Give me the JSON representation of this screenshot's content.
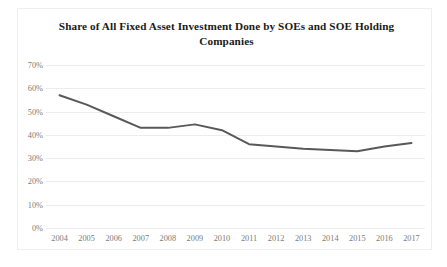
{
  "chart_data": {
    "type": "line",
    "title": "Share of All Fixed Asset Investment Done by SOEs and SOE Holding Companies",
    "title_line1": "Share of All Fixed Asset Investment Done by SOEs and SOE",
    "title_line2": "Holding Companies",
    "xlabel": "",
    "ylabel": "",
    "categories": [
      "2004",
      "2005",
      "2006",
      "2007",
      "2008",
      "2009",
      "2010",
      "2011",
      "2012",
      "2013",
      "2014",
      "2015",
      "2016",
      "2017"
    ],
    "values": [
      57,
      53,
      48,
      43,
      43,
      44.5,
      42,
      36,
      35,
      34,
      33.5,
      33,
      35,
      36.5
    ],
    "series": [
      {
        "name": "SOE and SOE holding share of fixed asset investment",
        "values": [
          57,
          53,
          48,
          43,
          43,
          44.5,
          42,
          36,
          35,
          34,
          33.5,
          33,
          35,
          36.5
        ]
      }
    ],
    "ylim": [
      0,
      70
    ],
    "ytick_labels": [
      "70%",
      "60%",
      "50%",
      "40%",
      "30%",
      "20%",
      "10%",
      "0%"
    ],
    "ytick_values": [
      70,
      60,
      50,
      40,
      30,
      20,
      10,
      0
    ],
    "grid": true,
    "legend": false,
    "legend_position": "none",
    "markers": false,
    "line_color": "#595959",
    "gridline_color": "#ececec",
    "tick_label_color": "#7b7b7b",
    "title_color": "#1a1a1a",
    "background_color": "#ffffff",
    "border_color": "#efefef"
  },
  "caption": {
    "partial_text": ""
  }
}
